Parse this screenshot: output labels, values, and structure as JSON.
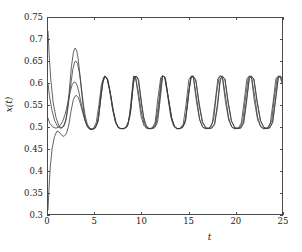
{
  "chart_data": {
    "type": "line",
    "title": "",
    "xlabel": "t",
    "ylabel": "x(t)",
    "xlim": [
      0,
      25
    ],
    "ylim": [
      0.3,
      0.75
    ],
    "xticks": [
      "0",
      "5",
      "10",
      "15",
      "20",
      "25"
    ],
    "xtick_values": [
      0,
      5,
      10,
      15,
      20,
      25
    ],
    "yticks": [
      "0.3",
      "0.35",
      "0.4",
      "0.45",
      "0.5",
      "0.55",
      "0.6",
      "0.65",
      "0.7",
      "0.75"
    ],
    "ytick_values": [
      0.3,
      0.35,
      0.4,
      0.45,
      0.5,
      0.55,
      0.6,
      0.65,
      0.7,
      0.75
    ],
    "grid": false,
    "legend": "none",
    "line_color": "#3c3c3c",
    "frame_color": "#4a4a4a",
    "background": "#ffffff",
    "annotation": "Four trajectories with different initial conditions converge onto a common limit cycle of period about 3.1 oscillating between 0.498 and 0.617",
    "limit_cycle": {
      "period": 3.1,
      "min": 0.498,
      "max": 0.617,
      "peak_times": [
        6.05,
        9.15,
        12.25,
        15.35,
        18.45,
        21.55,
        24.65
      ],
      "trough_times": [
        4.6,
        7.7,
        10.8,
        13.9,
        17.0,
        20.1,
        23.2
      ]
    },
    "series": [
      {
        "name": "trajectory-1",
        "initial_value": 0.72,
        "x": [
          0,
          0.12,
          0.3,
          0.55,
          0.85,
          1.15,
          1.45,
          1.75,
          2.0,
          2.25,
          2.5,
          2.72,
          2.9,
          3.05,
          3.2,
          3.4,
          3.6,
          3.8,
          4.0,
          4.2,
          4.45,
          4.7,
          5.0,
          5.3,
          5.55,
          5.8,
          6.05,
          6.3,
          6.6,
          6.9,
          7.2,
          7.5,
          7.75,
          8.0,
          8.3,
          8.65,
          9.0,
          9.15,
          9.35,
          9.7,
          10.0,
          10.3,
          10.6,
          10.9,
          11.2,
          11.5,
          11.8,
          12.1,
          12.25,
          12.45,
          12.8,
          13.1,
          13.4,
          13.7,
          14.0,
          14.3,
          14.6,
          14.9,
          15.2,
          15.35,
          15.55,
          15.9,
          16.2,
          16.5,
          16.8,
          17.1,
          17.4,
          17.7,
          18.0,
          18.3,
          18.45,
          18.65,
          19.0,
          19.3,
          19.6,
          19.9,
          20.2,
          20.5,
          20.8,
          21.1,
          21.4,
          21.55,
          21.75,
          22.1,
          22.4,
          22.7,
          23.0,
          23.3,
          23.6,
          23.9,
          24.2,
          24.5,
          24.65,
          24.85,
          25
        ],
        "y": [
          0.72,
          0.668,
          0.608,
          0.556,
          0.522,
          0.503,
          0.497,
          0.503,
          0.527,
          0.578,
          0.638,
          0.672,
          0.681,
          0.676,
          0.66,
          0.622,
          0.577,
          0.538,
          0.512,
          0.5,
          0.494,
          0.494,
          0.497,
          0.51,
          0.552,
          0.598,
          0.617,
          0.612,
          0.584,
          0.543,
          0.512,
          0.499,
          0.496,
          0.496,
          0.498,
          0.515,
          0.586,
          0.617,
          0.614,
          0.575,
          0.53,
          0.505,
          0.497,
          0.496,
          0.497,
          0.503,
          0.535,
          0.598,
          0.617,
          0.615,
          0.57,
          0.524,
          0.503,
          0.496,
          0.496,
          0.498,
          0.507,
          0.548,
          0.608,
          0.617,
          0.612,
          0.562,
          0.518,
          0.5,
          0.496,
          0.496,
          0.5,
          0.518,
          0.576,
          0.616,
          0.617,
          0.613,
          0.565,
          0.521,
          0.501,
          0.496,
          0.496,
          0.499,
          0.512,
          0.566,
          0.613,
          0.617,
          0.614,
          0.568,
          0.522,
          0.502,
          0.496,
          0.496,
          0.499,
          0.514,
          0.57,
          0.614,
          0.617,
          0.614,
          0.606
        ]
      },
      {
        "name": "trajectory-2",
        "initial_value": 0.6,
        "x": [
          0,
          0.15,
          0.4,
          0.7,
          1.0,
          1.3,
          1.6,
          1.9,
          2.15,
          2.4,
          2.65,
          2.85,
          3.0,
          3.15,
          3.35,
          3.55,
          3.75,
          3.95,
          4.2,
          4.45,
          4.75,
          5.05,
          5.35,
          5.6,
          5.85,
          6.05,
          6.3,
          6.6,
          6.9,
          7.2,
          7.5,
          7.8,
          8.1,
          8.45,
          8.8,
          9.1,
          9.3,
          9.6,
          9.9,
          10.2,
          10.5,
          10.8,
          11.1,
          11.4,
          11.7,
          12.0,
          12.25,
          12.5,
          12.85,
          13.2,
          13.5,
          13.8,
          14.1,
          14.4,
          14.7,
          15.0,
          15.3,
          15.5,
          15.8,
          16.15,
          16.5,
          16.85,
          17.2,
          17.5,
          17.8,
          18.1,
          18.4,
          18.6,
          18.9,
          19.25,
          19.6,
          19.95,
          20.3,
          20.6,
          20.9,
          21.2,
          21.5,
          21.7,
          22.0,
          22.35,
          22.7,
          23.05,
          23.4,
          23.7,
          24.0,
          24.3,
          24.6,
          24.8,
          25
        ],
        "y": [
          0.6,
          0.572,
          0.54,
          0.515,
          0.502,
          0.497,
          0.5,
          0.514,
          0.546,
          0.592,
          0.632,
          0.649,
          0.651,
          0.645,
          0.626,
          0.594,
          0.558,
          0.528,
          0.506,
          0.497,
          0.494,
          0.497,
          0.512,
          0.558,
          0.601,
          0.616,
          0.611,
          0.582,
          0.541,
          0.511,
          0.498,
          0.496,
          0.496,
          0.5,
          0.528,
          0.598,
          0.616,
          0.613,
          0.568,
          0.524,
          0.503,
          0.496,
          0.496,
          0.498,
          0.51,
          0.565,
          0.617,
          0.614,
          0.568,
          0.522,
          0.502,
          0.496,
          0.496,
          0.499,
          0.514,
          0.572,
          0.615,
          0.617,
          0.608,
          0.554,
          0.512,
          0.498,
          0.496,
          0.497,
          0.505,
          0.544,
          0.606,
          0.617,
          0.61,
          0.557,
          0.514,
          0.499,
          0.496,
          0.497,
          0.508,
          0.555,
          0.611,
          0.617,
          0.61,
          0.558,
          0.515,
          0.499,
          0.496,
          0.498,
          0.51,
          0.559,
          0.613,
          0.617,
          0.612
        ]
      },
      {
        "name": "trajectory-3",
        "initial_value": 0.52,
        "x": [
          0,
          0.2,
          0.5,
          0.85,
          1.2,
          1.55,
          1.85,
          2.1,
          2.35,
          2.6,
          2.8,
          2.95,
          3.1,
          3.3,
          3.5,
          3.7,
          3.95,
          4.2,
          4.5,
          4.8,
          5.1,
          5.4,
          5.65,
          5.9,
          6.1,
          6.35,
          6.65,
          6.95,
          7.25,
          7.55,
          7.85,
          8.15,
          8.5,
          8.85,
          9.15,
          9.35,
          9.65,
          9.95,
          10.25,
          10.55,
          10.85,
          11.15,
          11.45,
          11.75,
          12.05,
          12.25,
          12.5,
          12.85,
          13.2,
          13.5,
          13.8,
          14.1,
          14.4,
          14.7,
          15.0,
          15.3,
          15.5,
          15.8,
          16.15,
          16.5,
          16.85,
          17.2,
          17.5,
          17.8,
          18.1,
          18.4,
          18.6,
          18.9,
          19.25,
          19.6,
          19.95,
          20.3,
          20.6,
          20.9,
          21.2,
          21.5,
          21.7,
          22.0,
          22.35,
          22.7,
          23.05,
          23.4,
          23.7,
          24.0,
          24.3,
          24.6,
          24.8,
          25
        ],
        "y": [
          0.52,
          0.508,
          0.5,
          0.497,
          0.5,
          0.512,
          0.53,
          0.553,
          0.58,
          0.598,
          0.603,
          0.602,
          0.596,
          0.58,
          0.558,
          0.537,
          0.516,
          0.503,
          0.496,
          0.495,
          0.5,
          0.521,
          0.568,
          0.606,
          0.616,
          0.61,
          0.578,
          0.538,
          0.51,
          0.498,
          0.496,
          0.496,
          0.502,
          0.54,
          0.616,
          0.615,
          0.57,
          0.524,
          0.503,
          0.496,
          0.496,
          0.498,
          0.511,
          0.567,
          0.614,
          0.617,
          0.613,
          0.566,
          0.521,
          0.501,
          0.496,
          0.496,
          0.5,
          0.517,
          0.576,
          0.616,
          0.617,
          0.605,
          0.55,
          0.51,
          0.498,
          0.496,
          0.498,
          0.508,
          0.552,
          0.609,
          0.617,
          0.609,
          0.555,
          0.513,
          0.498,
          0.496,
          0.498,
          0.51,
          0.559,
          0.612,
          0.617,
          0.609,
          0.556,
          0.514,
          0.499,
          0.496,
          0.498,
          0.511,
          0.561,
          0.613,
          0.617,
          0.611
        ]
      },
      {
        "name": "trajectory-4",
        "initial_value": 0.31,
        "x": [
          0,
          0.1,
          0.25,
          0.45,
          0.7,
          0.95,
          1.2,
          1.45,
          1.7,
          1.95,
          2.2,
          2.45,
          2.7,
          2.9,
          3.05,
          3.25,
          3.45,
          3.7,
          3.95,
          4.25,
          4.55,
          4.85,
          5.15,
          5.45,
          5.7,
          5.95,
          6.15,
          6.4,
          6.7,
          7.0,
          7.3,
          7.6,
          7.9,
          8.2,
          8.55,
          8.9,
          9.2,
          9.4,
          9.7,
          10.0,
          10.3,
          10.6,
          10.9,
          11.2,
          11.5,
          11.8,
          12.1,
          12.3,
          12.55,
          12.9,
          13.25,
          13.55,
          13.85,
          14.15,
          14.45,
          14.75,
          15.05,
          15.35,
          15.55,
          15.85,
          16.2,
          16.55,
          16.9,
          17.25,
          17.55,
          17.85,
          18.15,
          18.45,
          18.65,
          18.95,
          19.3,
          19.65,
          20.0,
          20.35,
          20.65,
          20.95,
          21.25,
          21.55,
          21.75,
          22.05,
          22.4,
          22.75,
          23.1,
          23.45,
          23.75,
          24.05,
          24.35,
          24.65,
          24.85,
          25
        ],
        "y": [
          0.31,
          0.355,
          0.41,
          0.452,
          0.478,
          0.49,
          0.488,
          0.481,
          0.478,
          0.484,
          0.502,
          0.535,
          0.562,
          0.571,
          0.572,
          0.567,
          0.554,
          0.534,
          0.515,
          0.5,
          0.494,
          0.496,
          0.51,
          0.552,
          0.596,
          0.614,
          0.616,
          0.608,
          0.574,
          0.535,
          0.508,
          0.497,
          0.496,
          0.497,
          0.506,
          0.552,
          0.612,
          0.617,
          0.607,
          0.552,
          0.511,
          0.498,
          0.496,
          0.497,
          0.507,
          0.552,
          0.61,
          0.617,
          0.611,
          0.56,
          0.516,
          0.499,
          0.496,
          0.497,
          0.507,
          0.552,
          0.609,
          0.617,
          0.611,
          0.56,
          0.516,
          0.499,
          0.496,
          0.498,
          0.509,
          0.556,
          0.611,
          0.617,
          0.611,
          0.559,
          0.516,
          0.499,
          0.496,
          0.498,
          0.509,
          0.557,
          0.611,
          0.617,
          0.611,
          0.559,
          0.516,
          0.499,
          0.496,
          0.498,
          0.509,
          0.557,
          0.611,
          0.617,
          0.611,
          0.6
        ]
      }
    ]
  }
}
